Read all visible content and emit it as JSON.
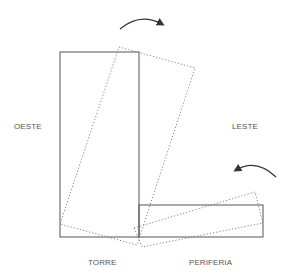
{
  "labels": {
    "west": "OESTE",
    "east": "LESTE",
    "tower": "TORRE",
    "periphery": "PERIFERIA"
  },
  "colors": {
    "stroke": "#555555",
    "dotted": "#777777",
    "arrow": "#333333",
    "text": "#555555",
    "background": "#ffffff"
  },
  "shapes": {
    "tower_rect": {
      "x": 60,
      "y": 52,
      "width": 79,
      "height": 185
    },
    "periphery_rect": {
      "x": 139,
      "y": 205,
      "width": 124,
      "height": 32
    },
    "tower_rotated_points": "119,47 195,68 137,245 60,224",
    "periphery_rotated_points": "134,228 255,192 263,223 142,247"
  },
  "arrows": {
    "top": {
      "direction": "clockwise",
      "path": "M120,29 Q140,12 162,24"
    },
    "bottom": {
      "direction": "counter-clockwise",
      "path": "M276,177 Q256,158 236,170"
    }
  }
}
